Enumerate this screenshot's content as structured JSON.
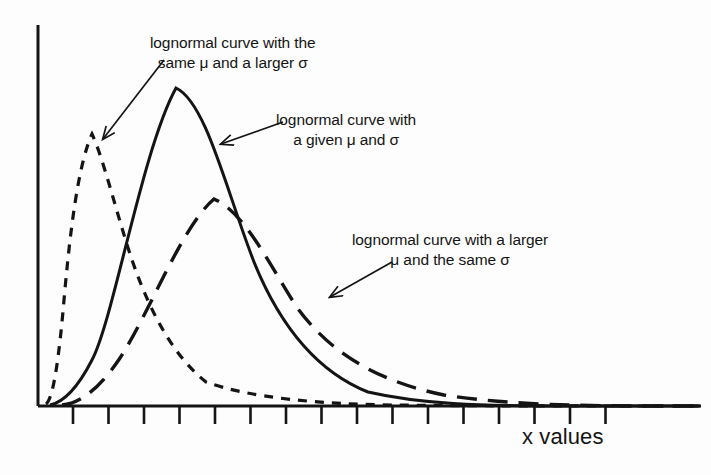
{
  "figure": {
    "background_color": "#fdfdfd",
    "ink_color": "#141414"
  },
  "axes": {
    "x_label": "x values",
    "y_label": ""
  },
  "annotations": [
    {
      "id": "anno-1",
      "name": "annotation-larger-sigma",
      "line1": "lognormal curve with the",
      "line2": "same μ and a larger σ",
      "points_to": "short-dashed-curve"
    },
    {
      "id": "anno-2",
      "name": "annotation-given-mu-sigma",
      "line1": "lognormal curve with",
      "line2": "a given μ and σ",
      "points_to": "solid-curve"
    },
    {
      "id": "anno-3",
      "name": "annotation-larger-mu",
      "line1": "lognormal curve with a larger",
      "line2": "μ and the same σ",
      "points_to": "long-dashed-curve"
    }
  ],
  "chart_data": {
    "type": "line",
    "title": "",
    "xlabel": "x values",
    "ylabel": "",
    "grid": false,
    "legend_position": "inline-annotations",
    "xlim": [
      0,
      1
    ],
    "ylim": [
      0,
      1
    ],
    "x_axis": {
      "tick_count": 16,
      "tick_labels": [],
      "first_tick_px": 73,
      "tick_spacing_px": 35.5,
      "axis_y_px": 406,
      "axis_x_start_px": 38,
      "axis_x_end_px": 700
    },
    "y_axis": {
      "tick_labels": [],
      "axis_x_px": 38,
      "axis_y_top_px": 25,
      "axis_y_bottom_px": 406
    },
    "series": [
      {
        "name": "lognormal curve with the same μ and a larger σ",
        "style": "short-dashed",
        "dash_pattern": "9 8",
        "peak_x_px": 92,
        "peak_y_px": 133,
        "path": "M 46,404 C 52,400 58,370 64,300 C 70,232 78,165 92,134 C 104,160 116,212 132,260 C 152,318 176,358 206,382 C 250,398 320,404 392,405 C 470,406 560,406 700,406"
      },
      {
        "name": "lognormal curve with a given μ and σ",
        "style": "solid",
        "dash_pattern": "none",
        "peak_x_px": 176,
        "peak_y_px": 88,
        "path": "M 50,405 C 60,403 74,395 92,360 C 114,318 142,150 176,88 C 206,102 226,190 254,262 C 280,326 318,372 368,392 C 420,404 480,406 560,406 C 620,406 660,406 700,406"
      },
      {
        "name": "lognormal curve with a larger μ and the same σ",
        "style": "long-dashed",
        "dash_pattern": "20 11",
        "peak_x_px": 214,
        "peak_y_px": 198,
        "path": "M 62,405 C 76,404 96,394 120,358 C 150,312 182,226 214,199 C 244,212 268,262 296,306 C 330,354 380,382 444,395 C 510,405 580,406 660,406 C 680,406 692,406 700,406"
      }
    ],
    "annotation_leaders": [
      {
        "name": "leader-larger-sigma",
        "from_px": [
          164,
          60
        ],
        "to_px": [
          103,
          139
        ]
      },
      {
        "name": "leader-given-mu-sigma",
        "from_px": [
          283,
          122
        ],
        "to_px": [
          221,
          144
        ]
      },
      {
        "name": "leader-larger-mu",
        "from_px": [
          392,
          262
        ],
        "to_px": [
          330,
          297
        ]
      }
    ]
  }
}
